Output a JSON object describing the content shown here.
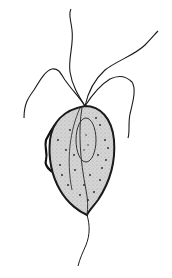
{
  "figure": {
    "parts": [
      "anterior-flagella",
      "undulating-membrane",
      "nucleus",
      "axostyle",
      "cytoplasm-granules",
      "posterior-flagellum"
    ],
    "colors": {
      "background": "#ffffff",
      "outline": "#1a1a1a",
      "cytoplasm": "#c8c8c8",
      "granules": "#222222"
    }
  }
}
